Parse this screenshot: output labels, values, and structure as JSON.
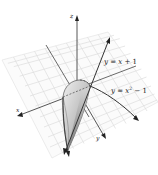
{
  "diagram": {
    "type": "3d-solid-region",
    "axes": {
      "x_label": "x",
      "y_label": "y",
      "z_label": "z"
    },
    "curves": [
      {
        "label": "y = x + 1",
        "text_main": "y = x + 1"
      },
      {
        "label": "y = x^2 - 1",
        "text_prefix": "y = x",
        "superscript": "2",
        "text_suffix": " − 1"
      }
    ],
    "colors": {
      "grid": "#d8d8d8",
      "axis": "#333333",
      "solid_light": "#e2e2e2",
      "solid_dark": "#8a8a8a",
      "background": "#ffffff"
    }
  }
}
